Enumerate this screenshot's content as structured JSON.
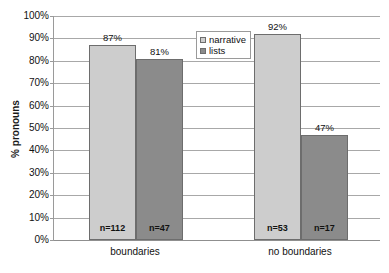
{
  "chart_data": {
    "type": "bar",
    "title": "",
    "subtitle": "",
    "xlabel": "",
    "ylabel": "% pronouns",
    "ylim": [
      0,
      100
    ],
    "grid": "horizontal",
    "legend_position": "top-center-right",
    "categories": [
      "boundaries",
      "no boundaries"
    ],
    "ytick_labels": [
      "0%",
      "10%",
      "20%",
      "30%",
      "40%",
      "50%",
      "60%",
      "70%",
      "80%",
      "90%",
      "100%"
    ],
    "ytick_values": [
      0,
      10,
      20,
      30,
      40,
      50,
      60,
      70,
      80,
      90,
      100
    ],
    "series": [
      {
        "name": "narrative",
        "color": "#cdcdcd",
        "values": [
          87,
          92
        ],
        "value_labels": [
          "87%",
          "92%"
        ],
        "n_labels": [
          "n=112",
          "n=53"
        ]
      },
      {
        "name": "lists",
        "color": "#8b8b8b",
        "values": [
          81,
          47
        ],
        "value_labels": [
          "81%",
          "47%"
        ],
        "n_labels": [
          "n=47",
          "n=17"
        ]
      }
    ],
    "bars": [
      {
        "category": "boundaries",
        "series": "narrative",
        "value": 87,
        "value_label": "87%",
        "n_label": "n=112"
      },
      {
        "category": "boundaries",
        "series": "lists",
        "value": 92,
        "value_label": "92%",
        "n_label": "n=53"
      },
      {
        "category": "no boundaries",
        "series": "narrative",
        "value": 81,
        "value_label": "81%",
        "n_label": "n=47"
      },
      {
        "category": "no boundaries",
        "series": "lists",
        "value": 47,
        "value_label": "47%",
        "n_label": "n=17"
      }
    ]
  },
  "legend": {
    "items": [
      {
        "label": "narrative",
        "swatch": "narrative"
      },
      {
        "label": "lists",
        "swatch": "lists"
      }
    ]
  },
  "axis": {
    "y_title": "% pronouns"
  }
}
